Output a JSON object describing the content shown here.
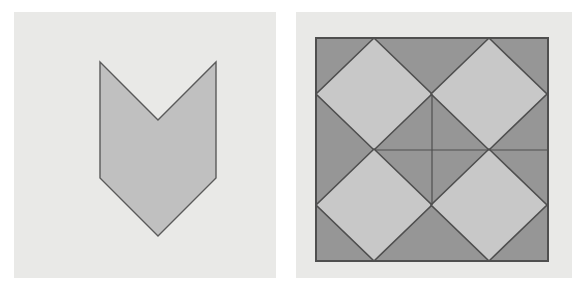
{
  "document": {
    "title": "Geometric Figures Pair",
    "width": 579,
    "height": 290,
    "page_background": "#ffffff"
  },
  "palette": {
    "panel_background": "#e9e9e7",
    "outer_background": "#ffffff",
    "shape_fill_light": "#c8c8c8",
    "shape_fill_mid": "#c0c0c0",
    "shape_fill_dark": "#969696",
    "stroke": "#5a5a5a",
    "thin_stroke": "#6a6a6a"
  },
  "figures": [
    {
      "id": "figure-left",
      "name": "chevron-hexagon",
      "label": "",
      "panel": {
        "x": 0,
        "y": 0,
        "width": 290,
        "height": 290
      },
      "background": "#e9e9e7",
      "shape": {
        "type": "polygon",
        "fill": "#c0c0c0",
        "stroke": "#5a5a5a",
        "stroke_width": 1.4,
        "vertices": [
          {
            "x": 100,
            "y": 62,
            "name": "top-left-corner"
          },
          {
            "x": 158,
            "y": 120,
            "name": "notch-vertex"
          },
          {
            "x": 216,
            "y": 62,
            "name": "top-right-corner"
          },
          {
            "x": 216,
            "y": 178,
            "name": "right-corner"
          },
          {
            "x": 158,
            "y": 236,
            "name": "bottom-apex"
          },
          {
            "x": 100,
            "y": 178,
            "name": "left-corner"
          }
        ]
      }
    },
    {
      "id": "figure-right",
      "name": "four-diamond-square-tiling",
      "label": "",
      "panel": {
        "x": 290,
        "y": 0,
        "width": 289,
        "height": 290
      },
      "background": "#e9e9e7",
      "frame": {
        "type": "rect",
        "name": "outer-square",
        "x": 316,
        "y": 38,
        "width": 232,
        "height": 223,
        "fill": "#969696",
        "stroke": "#4f4f4f",
        "stroke_width": 2
      },
      "diamonds": [
        {
          "name": "diamond-top-left",
          "center": {
            "x": 374,
            "y": 94
          },
          "rx": 58,
          "ry": 56,
          "fill": "#c8c8c8",
          "stroke": "#4f4f4f",
          "stroke_width": 1.6
        },
        {
          "name": "diamond-top-right",
          "center": {
            "x": 489,
            "y": 94
          },
          "rx": 58,
          "ry": 56,
          "fill": "#c8c8c8",
          "stroke": "#4f4f4f",
          "stroke_width": 1.6
        },
        {
          "name": "diamond-bottom-left",
          "center": {
            "x": 374,
            "y": 205
          },
          "rx": 58,
          "ry": 56,
          "fill": "#c8c8c8",
          "stroke": "#4f4f4f",
          "stroke_width": 1.6
        },
        {
          "name": "diamond-bottom-right",
          "center": {
            "x": 489,
            "y": 205
          },
          "rx": 58,
          "ry": 56,
          "fill": "#c8c8c8",
          "stroke": "#4f4f4f",
          "stroke_width": 1.6
        }
      ],
      "inner_lines": [
        {
          "name": "vertical-median",
          "x1": 432,
          "y1": 94,
          "x2": 432,
          "y2": 205,
          "stroke": "#4f4f4f",
          "stroke_width": 1.2
        },
        {
          "name": "horizontal-median",
          "x1": 375,
          "y1": 150,
          "x2": 547,
          "y2": 150,
          "stroke": "#4f4f4f",
          "stroke_width": 1.2
        }
      ],
      "nodes": [
        {
          "name": "center-node-top",
          "x": 432,
          "y": 94
        },
        {
          "name": "center-node-left",
          "x": 375,
          "y": 150
        },
        {
          "name": "center-node-right",
          "x": 489,
          "y": 150
        },
        {
          "name": "center-node-bottom",
          "x": 432,
          "y": 205
        }
      ]
    }
  ]
}
